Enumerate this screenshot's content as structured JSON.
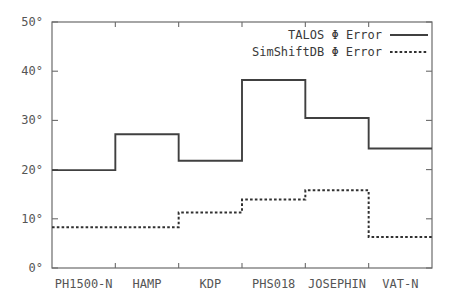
{
  "chart_data": {
    "type": "line",
    "subtype": "step",
    "title": "",
    "xlabel": "",
    "ylabel": "",
    "categories": [
      "PH1500-N",
      "HAMP",
      "KDP",
      "PHS018",
      "JOSEPHIN",
      "VAT-N"
    ],
    "series": [
      {
        "name": "TALOS Φ Error",
        "style": "solid",
        "color": "#404040",
        "values": [
          19.9,
          27.2,
          21.8,
          38.2,
          30.5,
          24.3
        ]
      },
      {
        "name": "SimShiftDB Φ Error",
        "style": "dotted",
        "color": "#303030",
        "values": [
          8.3,
          8.3,
          11.3,
          13.9,
          15.8,
          6.3
        ]
      }
    ],
    "ylim": [
      0,
      50
    ],
    "yticks": [
      0,
      10,
      20,
      30,
      40,
      50
    ],
    "ytick_labels": [
      "0°",
      "10°",
      "20°",
      "30°",
      "40°",
      "50°"
    ],
    "grid": false,
    "legend_position": "top-right",
    "legend_border": false
  },
  "legend": {
    "entries": [
      {
        "label": "TALOS Φ Error",
        "style": "solid"
      },
      {
        "label": "SimShiftDB Φ Error",
        "style": "dotted"
      }
    ]
  },
  "axes": {
    "y_labels": [
      "50°",
      "40°",
      "30°",
      "20°",
      "10°",
      "0°"
    ],
    "x_labels": [
      "PH1500-N",
      "HAMP",
      "KDP",
      "PHS018",
      "JOSEPHIN",
      "VAT-N"
    ]
  },
  "colors": {
    "axis": "#6b6b6b",
    "talos": "#404040",
    "simshiftdb": "#303030",
    "text": "#555555"
  }
}
